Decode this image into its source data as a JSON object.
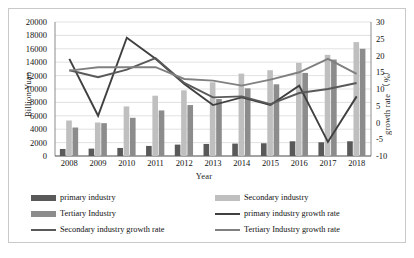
{
  "chart_data": {
    "type": "bar",
    "title": "",
    "xlabel": "Year",
    "ylabel": "Billion Yuan",
    "y2label": "growth rate （%）",
    "categories": [
      "2008",
      "2009",
      "2010",
      "2011",
      "2012",
      "2013",
      "2014",
      "2015",
      "2016",
      "2017",
      "2018"
    ],
    "ylim": [
      0,
      20000
    ],
    "yticks": [
      "0",
      "2000",
      "4000",
      "6000",
      "8000",
      "10000",
      "12000",
      "14000",
      "16000",
      "18000",
      "20000"
    ],
    "y2lim": [
      -10,
      30
    ],
    "y2ticks": [
      "-10",
      "-5",
      "0",
      "5",
      "10",
      "15",
      "20",
      "25",
      "30"
    ],
    "grid": true,
    "legend_position": "bottom",
    "bar_series": [
      {
        "name": "primary industry",
        "color": "#595959",
        "axis": "left",
        "values": [
          1050,
          1100,
          1200,
          1500,
          1700,
          1800,
          1850,
          1900,
          2200,
          2050,
          2200
        ]
      },
      {
        "name": "Secondary industry",
        "color": "#bfbfbf",
        "axis": "left",
        "values": [
          5300,
          5000,
          7400,
          9000,
          9800,
          11000,
          12300,
          12800,
          13900,
          15100,
          17000
        ]
      },
      {
        "name": "Tertiary Industry",
        "color": "#8c8c8c",
        "axis": "left",
        "values": [
          4250,
          4900,
          5700,
          6800,
          7600,
          8500,
          10100,
          10700,
          12400,
          14400,
          16000
        ]
      }
    ],
    "line_series": [
      {
        "name": "primary industry growth rate",
        "color": "#404040",
        "axis": "right",
        "values": [
          19.0,
          2.0,
          25.3,
          19.0,
          11.5,
          5.2,
          7.5,
          5.2,
          11.0,
          -5.8,
          7.8
        ]
      },
      {
        "name": "Secondary industry growth rate",
        "color": "#595959",
        "axis": "right",
        "values": [
          15.6,
          13.5,
          15.8,
          19.2,
          11.8,
          7.5,
          7.8,
          5.5,
          8.8,
          10.0,
          11.8
        ]
      },
      {
        "name": "Tertiary Industry growth rate",
        "color": "#808080",
        "axis": "right",
        "values": [
          15.5,
          16.5,
          16.5,
          16.5,
          13.0,
          12.5,
          11.0,
          12.8,
          15.0,
          19.0,
          14.5
        ]
      }
    ]
  }
}
